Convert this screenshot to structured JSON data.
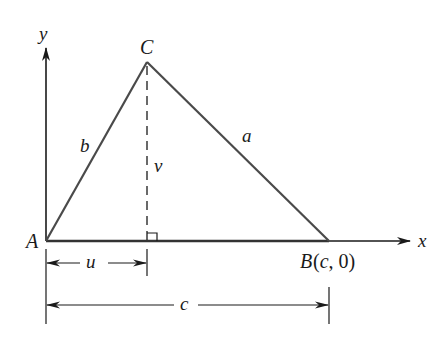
{
  "diagram": {
    "type": "triangle-on-coordinate-axes",
    "axes": {
      "x_label": "x",
      "y_label": "y"
    },
    "vertices": {
      "A": {
        "label": "A"
      },
      "B": {
        "label": "B",
        "coords_text": "(c, 0)"
      },
      "C": {
        "label": "C"
      }
    },
    "sides": {
      "a": "a",
      "b": "b"
    },
    "altitude_label": "v",
    "dimensions": {
      "u": "u",
      "c": "c"
    },
    "colors": {
      "stroke": "#1a1a1a",
      "side": "#4a4a4a",
      "background": "#ffffff"
    }
  }
}
